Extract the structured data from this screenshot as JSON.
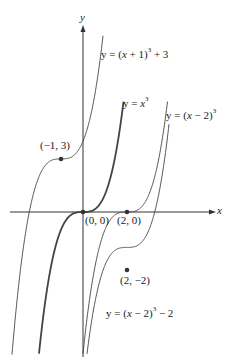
{
  "axes": {
    "x_label": "x",
    "y_label": "y"
  },
  "curves": [
    {
      "id": "base",
      "equation": "y = x^3",
      "label_pre": "y = ",
      "label_var": "x",
      "label_post": "",
      "exp": "3",
      "tail": "",
      "emphasis": "bold"
    },
    {
      "id": "shift-left-up",
      "equation": "y = (x + 1)^3 + 3",
      "label_pre": "y = (",
      "label_var": "x",
      "label_post": " + 1)",
      "exp": "3",
      "tail": " + 3"
    },
    {
      "id": "shift-right",
      "equation": "y = (x − 2)^3",
      "label_pre": "y = (",
      "label_var": "x",
      "label_post": " − 2)",
      "exp": "3",
      "tail": ""
    },
    {
      "id": "shift-right-down",
      "equation": "y = (x − 2)^3 − 2",
      "label_pre": "y = (",
      "label_var": "x",
      "label_post": " − 2)",
      "exp": "3",
      "tail": " − 2"
    }
  ],
  "points": [
    {
      "label": "(−1, 3)"
    },
    {
      "label": "(0, 0)"
    },
    {
      "label": "(2, 0)"
    },
    {
      "label": "(2, −2)"
    }
  ],
  "chart_data": {
    "type": "line",
    "title": "",
    "xlabel": "x",
    "ylabel": "y",
    "series": [
      {
        "name": "y = x^3",
        "inflection": [
          0,
          0
        ]
      },
      {
        "name": "y = (x + 1)^3 + 3",
        "inflection": [
          -1,
          3
        ]
      },
      {
        "name": "y = (x − 2)^3",
        "inflection": [
          2,
          0
        ]
      },
      {
        "name": "y = (x − 2)^3 − 2",
        "inflection": [
          2,
          -2
        ]
      }
    ],
    "grid": false
  }
}
